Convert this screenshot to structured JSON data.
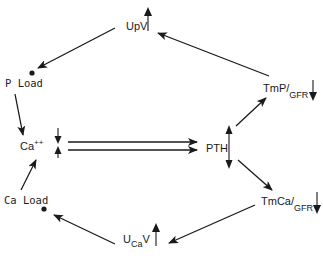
{
  "diagram": {
    "colors": {
      "ink": "#1a1a1a",
      "background": "#ffffff"
    },
    "nodes": {
      "upv": {
        "base": "UpV",
        "direction": "up"
      },
      "p_load": {
        "label": "P Load",
        "marker": "dot"
      },
      "ca": {
        "base": "Ca",
        "superscript": "++",
        "direction": "down-and-up"
      },
      "ca_load": {
        "label": "Ca Load",
        "marker": "dot"
      },
      "u_ca_v": {
        "base": "U",
        "subscript": "Ca",
        "suffix": "V",
        "direction": "up"
      },
      "tmca_gfr": {
        "base": "TmCa/",
        "subscript": "GFR",
        "direction": "down"
      },
      "pth": {
        "label": "PTH",
        "direction": "up-and-down"
      },
      "tmp_gfr": {
        "base": "TmP/",
        "subscript": "GFR",
        "direction": "down"
      }
    },
    "edges": [
      {
        "from": "tmp_gfr",
        "to": "upv"
      },
      {
        "from": "upv",
        "to": "p_load"
      },
      {
        "from": "p_load",
        "to": "ca"
      },
      {
        "from": "ca",
        "to": "pth",
        "style": "double"
      },
      {
        "from": "pth",
        "to": "tmp_gfr"
      },
      {
        "from": "pth",
        "to": "tmca_gfr"
      },
      {
        "from": "tmca_gfr",
        "to": "u_ca_v"
      },
      {
        "from": "u_ca_v",
        "to": "ca_load"
      },
      {
        "from": "ca_load",
        "to": "ca"
      }
    ]
  }
}
